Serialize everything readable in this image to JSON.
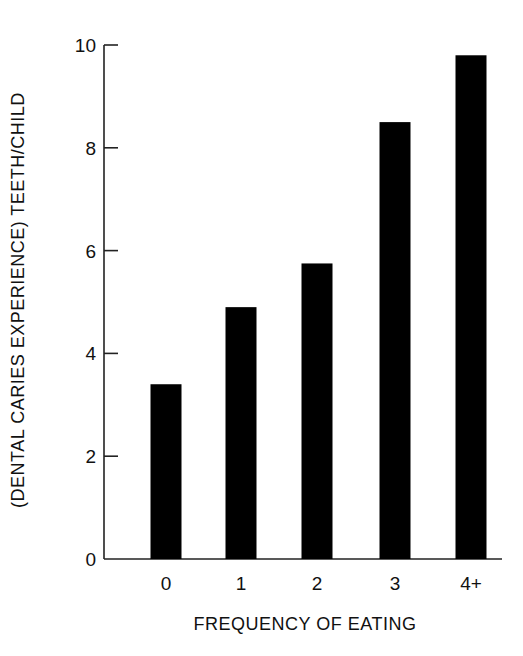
{
  "chart_data": {
    "type": "bar",
    "title": "",
    "xlabel": "FREQUENCY OF EATING",
    "ylabel": "(DENTAL CARIES EXPERIENCE) TEETH/CHILD",
    "categories": [
      "0",
      "1",
      "2",
      "3",
      "4+"
    ],
    "values": [
      3.4,
      4.9,
      5.75,
      8.5,
      9.8
    ],
    "ylim": [
      0,
      10
    ],
    "yticks": [
      0,
      2,
      4,
      6,
      8,
      10
    ],
    "grid": false,
    "legend": null,
    "bar_color": "#000000"
  }
}
